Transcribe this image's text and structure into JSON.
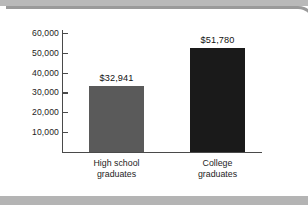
{
  "chart_data": {
    "type": "bar",
    "title": "",
    "subtitle": "",
    "xlabel": "",
    "ylabel": "",
    "categories": [
      "High school graduates",
      "College graduates"
    ],
    "category_lines": [
      [
        "High school",
        "graduates"
      ],
      [
        "College",
        "graduates"
      ]
    ],
    "values": [
      32941,
      51780
    ],
    "value_labels": [
      "$32,941",
      "$51,780"
    ],
    "bar_colors": [
      "#5a5a5a",
      "#1a1a1a"
    ],
    "ylim": [
      0,
      62000
    ],
    "yticks": [
      10000,
      20000,
      30000,
      40000,
      50000,
      60000
    ],
    "ytick_labels": [
      "10,000",
      "20,000",
      "30,000",
      "40,000",
      "50,000",
      "60,000"
    ],
    "grid": false,
    "legend": null
  },
  "frame": {
    "border_color": "#9a9a9a",
    "band_color": "#b9b9b9",
    "background": "#ffffff"
  },
  "axis": {
    "line_color": "#4a4a4a"
  }
}
